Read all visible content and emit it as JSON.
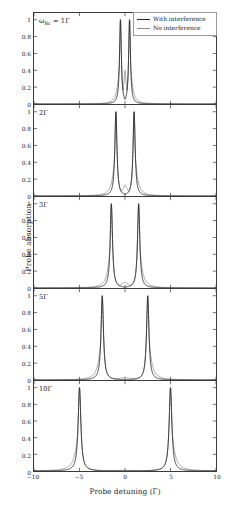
{
  "figure": {
    "xlabel": "Probe detuning (Γ)",
    "ylabel": "Probe absorption"
  },
  "legend": {
    "items": [
      {
        "label": "With interference",
        "color": "#262626"
      },
      {
        "label": "No interference",
        "color": "#8c8c8c"
      }
    ]
  },
  "axis": {
    "xticks": [
      "−10",
      "−5",
      "0",
      "5",
      "10"
    ],
    "xtick_values": [
      -10,
      -5,
      0,
      5,
      10
    ],
    "yticks": [
      "0",
      "0.2",
      "0.4",
      "0.6",
      "0.8",
      "1"
    ],
    "ytick_values": [
      0,
      0.2,
      0.4,
      0.6,
      0.8,
      1
    ]
  },
  "panels": [
    {
      "label_prefix": "ω",
      "label_sub": "Rc",
      "label_eq": " = 1Γ",
      "label": "ωRc = 1Γ",
      "rabi": 1
    },
    {
      "label": "2Γ",
      "rabi": 2
    },
    {
      "label": "3Γ",
      "rabi": 3
    },
    {
      "label": "5Γ",
      "rabi": 5
    },
    {
      "label": "10Γ",
      "rabi": 10
    }
  ],
  "chart_data": {
    "type": "line",
    "title": "",
    "xlabel": "Probe detuning (Γ)",
    "ylabel": "Probe absorption",
    "xlim": [
      -10,
      10
    ],
    "ylim": [
      0,
      1.08
    ],
    "grid": false,
    "legend_position": "top-right",
    "n_panels": 5,
    "panel_parameter": "ωRc (control Rabi frequency)",
    "panels": [
      {
        "panel_label": "ωRc = 1Γ",
        "rabi": 1,
        "peak_positions": [
          -0.5,
          0.5
        ],
        "peak_height": 1.0,
        "linewidth_gamma": 0.12,
        "series": [
          {
            "name": "With interference",
            "color": "#262626",
            "center_value": 0.0,
            "description": "Two sharp peaks at ±0.5Γ reaching 1; destructive interference drives absorption exactly to 0 at zero detuning."
          },
          {
            "name": "No interference",
            "color": "#8c8c8c",
            "center_value": 0.4,
            "description": "Same doublet but the dip between peaks only falls to about 0.4; broader far wings."
          }
        ]
      },
      {
        "panel_label": "2Γ",
        "rabi": 2,
        "peak_positions": [
          -1.0,
          1.0
        ],
        "peak_height": 1.0,
        "linewidth_gamma": 0.14,
        "series": [
          {
            "name": "With interference",
            "color": "#262626",
            "center_value": 0.0,
            "description": "Doublet at ±1Γ, absorption zero at line center."
          },
          {
            "name": "No interference",
            "color": "#8c8c8c",
            "center_value": 0.13,
            "description": "Doublet at ±1Γ with shallow residual absorption ≈0.13 at center."
          }
        ]
      },
      {
        "panel_label": "3Γ",
        "rabi": 3,
        "peak_positions": [
          -1.5,
          1.5
        ],
        "peak_height": 1.0,
        "linewidth_gamma": 0.15,
        "series": [
          {
            "name": "With interference",
            "color": "#262626",
            "center_value": 0.0,
            "description": "Doublet at ±1.5Γ, zero at center."
          },
          {
            "name": "No interference",
            "color": "#8c8c8c",
            "center_value": 0.07,
            "description": "Doublet at ±1.5Γ, center residual ≈0.07."
          }
        ]
      },
      {
        "panel_label": "5Γ",
        "rabi": 5,
        "peak_positions": [
          -2.5,
          2.5
        ],
        "peak_height": 1.0,
        "linewidth_gamma": 0.16,
        "series": [
          {
            "name": "With interference",
            "color": "#262626",
            "center_value": 0.0,
            "description": "Well separated doublet at ±2.5Γ, zero at center."
          },
          {
            "name": "No interference",
            "color": "#8c8c8c",
            "center_value": 0.03,
            "description": "Nearly identical doublet; center residual ≈0.03."
          }
        ]
      },
      {
        "panel_label": "10Γ",
        "rabi": 10,
        "peak_positions": [
          -5.0,
          5.0
        ],
        "peak_height": 1.0,
        "linewidth_gamma": 0.18,
        "series": [
          {
            "name": "With interference",
            "color": "#262626",
            "center_value": 0.0,
            "description": "Two fully resolved Autler–Townes peaks at ±5Γ with flat zero baseline between them."
          },
          {
            "name": "No interference",
            "color": "#8c8c8c",
            "center_value": 0.008,
            "description": "Essentially overlapping the interference curve — the two models coincide at large splitting."
          }
        ]
      }
    ]
  }
}
